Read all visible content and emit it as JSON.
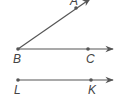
{
  "diagram": {
    "type": "geometry-rays",
    "colors": {
      "line": "#555555",
      "point": "#555555",
      "label": "#444444",
      "background": "#ffffff"
    },
    "points": {
      "A": {
        "label": "A",
        "x": 76,
        "y": 8
      },
      "B": {
        "label": "B",
        "x": 18,
        "y": 49
      },
      "C": {
        "label": "C",
        "x": 88,
        "y": 49
      },
      "L": {
        "label": "L",
        "x": 18,
        "y": 80
      },
      "K": {
        "label": "K",
        "x": 91,
        "y": 80
      }
    },
    "rays": [
      {
        "name": "ray-BA",
        "from": "B",
        "through": "A"
      },
      {
        "name": "ray-BC",
        "from": "B",
        "through": "C"
      },
      {
        "name": "ray-LK",
        "from": "L",
        "through": "K"
      }
    ]
  }
}
